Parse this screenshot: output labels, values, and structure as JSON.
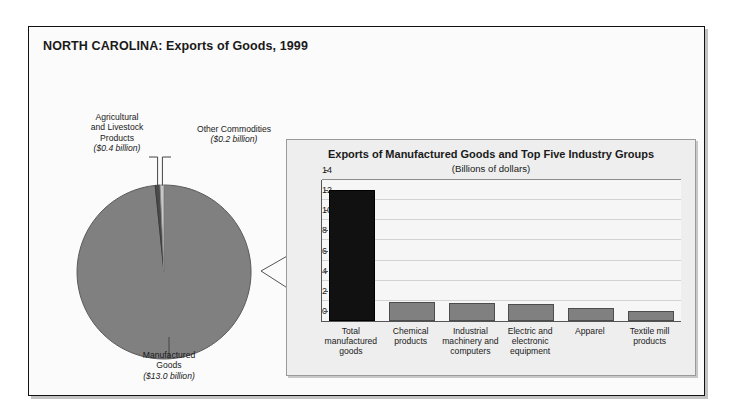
{
  "page_title": "NORTH CAROLINA: Exports of Goods, 1999",
  "colors": {
    "frame_border": "#111111",
    "pie_main": "#808080",
    "pie_agricultural": "#4a4a4a",
    "pie_other": "#c8c8c8",
    "bar_total": "#111111",
    "bar_group": "#808080",
    "panel_background": "#eeeeee",
    "gridline": "#d2d2d2"
  },
  "pie": {
    "labels": {
      "agricultural": {
        "name": "Agricultural\nand Livestock\nProducts",
        "amount": "($0.4 billion)"
      },
      "other": {
        "name": "Other Commodities",
        "amount": "($0.2 billion)"
      },
      "manufactured": {
        "name": "Manufactured\nGoods",
        "amount": "($13.0 billion)"
      }
    }
  },
  "bar_panel": {
    "title": "Exports of Manufactured Goods and Top Five Industry Groups",
    "subtitle": "(Billions of dollars)"
  },
  "chart_data": [
    {
      "type": "pie",
      "title": "NORTH CAROLINA: Exports of Goods, 1999",
      "unit": "Billions of dollars",
      "labels": [
        "Manufactured Goods",
        "Agricultural and Livestock Products",
        "Other Commodities"
      ],
      "values": [
        13.0,
        0.4,
        0.2
      ],
      "value_labels": [
        "($13.0 billion)",
        "($0.4 billion)",
        "($0.2 billion)"
      ],
      "colors": [
        "#808080",
        "#4a4a4a",
        "#c8c8c8"
      ],
      "total": 13.6,
      "legend": "callout-labels"
    },
    {
      "type": "bar",
      "title": "Exports of Manufactured Goods and Top Five Industry Groups",
      "subtitle": "(Billions of dollars)",
      "xlabel": "",
      "ylabel": "",
      "ylim": [
        0,
        14
      ],
      "yticks": [
        0,
        2,
        4,
        6,
        8,
        10,
        12,
        14
      ],
      "grid": true,
      "legend": "none",
      "categories": [
        "Total\nmanufactured\ngoods",
        "Chemical\nproducts",
        "Industrial\nmachinery and\ncomputers",
        "Electric and\nelectronic\nequipment",
        "Apparel",
        "Textile mill\nproducts"
      ],
      "values": [
        13.0,
        1.9,
        1.8,
        1.7,
        1.3,
        1.0
      ],
      "bar_colors": [
        "#111111",
        "#808080",
        "#808080",
        "#808080",
        "#808080",
        "#808080"
      ]
    }
  ]
}
